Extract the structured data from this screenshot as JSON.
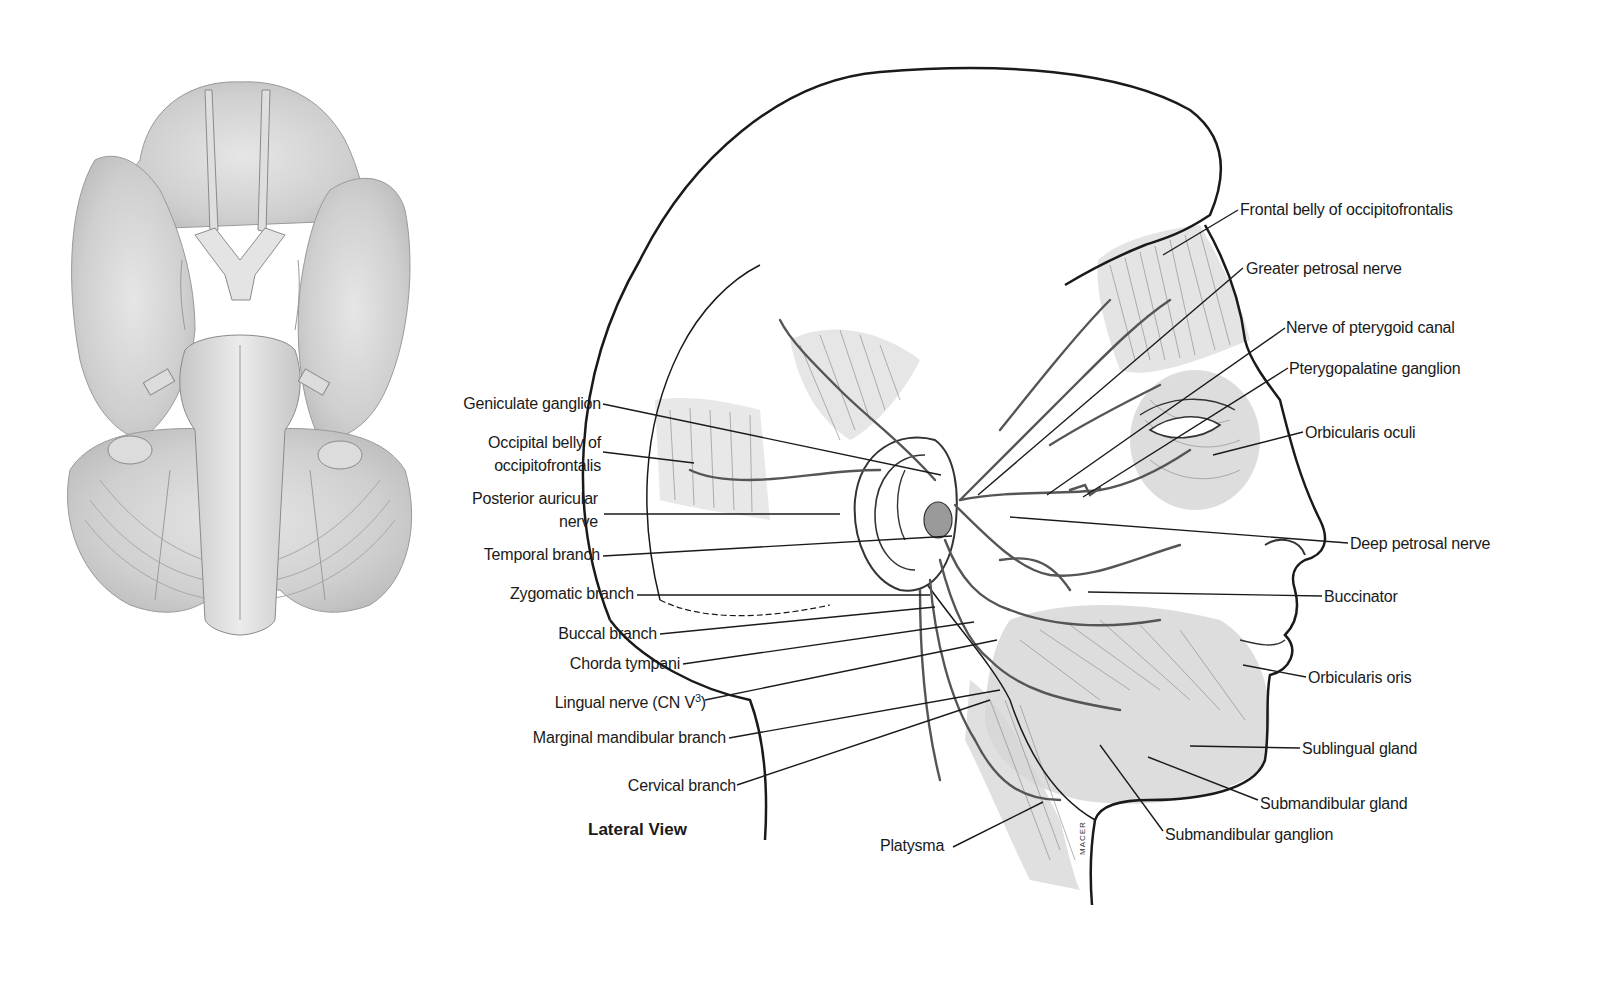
{
  "figure": {
    "caption": "Lateral View",
    "signature": "MACER",
    "left_panel": {
      "description": "Inferior view of brain (brainstem with cranial nerves)"
    },
    "labels_left": [
      {
        "id": "geniculate-ganglion",
        "text": "Geniculate ganglion"
      },
      {
        "id": "occipital-belly-line1",
        "text": "Occipital belly of"
      },
      {
        "id": "occipital-belly-line2",
        "text": "occipitofrontalis"
      },
      {
        "id": "posterior-auricular-line1",
        "text": "Posterior auricular"
      },
      {
        "id": "posterior-auricular-line2",
        "text": "nerve"
      },
      {
        "id": "temporal-branch",
        "text": "Temporal branch"
      },
      {
        "id": "zygomatic-branch",
        "text": "Zygomatic branch"
      },
      {
        "id": "buccal-branch",
        "text": "Buccal branch"
      },
      {
        "id": "chorda-tympani",
        "text": "Chorda tympani"
      },
      {
        "id": "lingual-nerve",
        "text": "Lingual nerve (CN V",
        "sup": "3",
        "suffix": ")"
      },
      {
        "id": "marginal-mandibular-branch",
        "text": "Marginal mandibular branch"
      },
      {
        "id": "cervical-branch",
        "text": "Cervical branch"
      }
    ],
    "labels_right": [
      {
        "id": "frontal-belly",
        "text": "Frontal belly of occipitofrontalis"
      },
      {
        "id": "greater-petrosal-nerve",
        "text": "Greater petrosal nerve"
      },
      {
        "id": "nerve-pterygoid-canal",
        "text": "Nerve of pterygoid canal"
      },
      {
        "id": "pterygopalatine-ganglion",
        "text": "Pterygopalatine ganglion"
      },
      {
        "id": "orbicularis-oculi",
        "text": "Orbicularis oculi"
      },
      {
        "id": "deep-petrosal-nerve",
        "text": "Deep petrosal nerve"
      },
      {
        "id": "buccinator",
        "text": "Buccinator"
      },
      {
        "id": "orbicularis-oris",
        "text": "Orbicularis oris"
      },
      {
        "id": "sublingual-gland",
        "text": "Sublingual gland"
      },
      {
        "id": "submandibular-gland",
        "text": "Submandibular gland"
      },
      {
        "id": "submandibular-ganglion",
        "text": "Submandibular ganglion"
      }
    ],
    "labels_bottom": [
      {
        "id": "platysma",
        "text": "Platysma"
      }
    ],
    "colors": {
      "line": "#1a1a1a",
      "nerve": "#555555",
      "muscle_shade": "#c8c8c8",
      "background": "#ffffff"
    }
  }
}
